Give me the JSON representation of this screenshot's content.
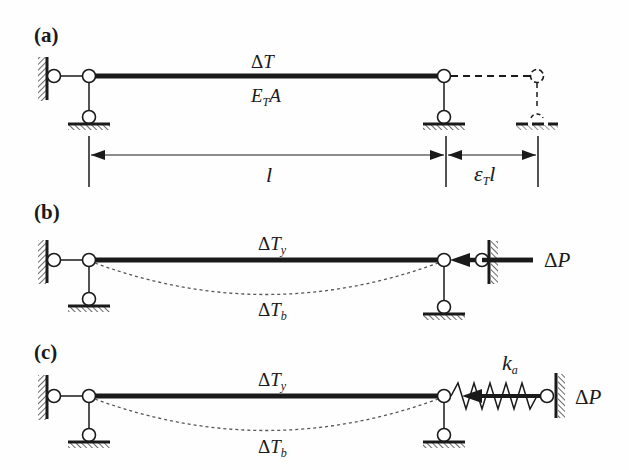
{
  "figure": {
    "panels": [
      {
        "id": "a",
        "label": "(a)",
        "bar_top_label": {
          "delta": "Δ",
          "sym": "T",
          "sub": ""
        },
        "bar_bottom_label": {
          "sym": "E",
          "sub": "T",
          "tail": "A"
        },
        "dimension_length": "l",
        "dimension_extension": {
          "sym": "ε",
          "sub": "T",
          "tail": "l"
        }
      },
      {
        "id": "b",
        "label": "(b)",
        "bar_top_label": {
          "delta": "Δ",
          "sym": "T",
          "sub": "y"
        },
        "curve_label": {
          "delta": "Δ",
          "sym": "T",
          "sub": "b"
        },
        "load_label": {
          "delta": "Δ",
          "sym": "P"
        }
      },
      {
        "id": "c",
        "label": "(c)",
        "bar_top_label": {
          "delta": "Δ",
          "sym": "T",
          "sub": "y"
        },
        "curve_label": {
          "delta": "Δ",
          "sym": "T",
          "sub": "b"
        },
        "spring_label": {
          "sym": "k",
          "sub": "a"
        },
        "load_label": {
          "delta": "Δ",
          "sym": "P"
        }
      }
    ],
    "colors": {
      "ink": "#1a1a1a",
      "dashed": "#555555",
      "background": "#fefefe"
    }
  }
}
